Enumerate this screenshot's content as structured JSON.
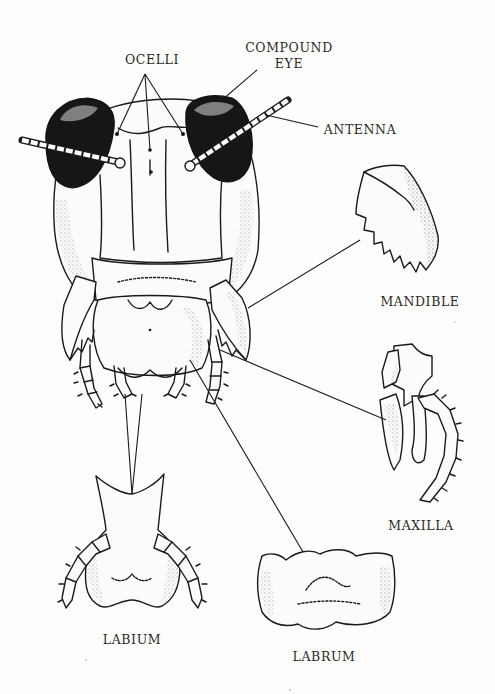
{
  "diagram": {
    "labels": {
      "ocelli": "OCELLI",
      "compound_eye_line1": "COMPOUND",
      "compound_eye_line2": "EYE",
      "antenna": "ANTENNA",
      "mandible": "MANDIBLE",
      "maxilla": "MAXILLA",
      "labium": "LABIUM",
      "labrum": "LABRUM"
    },
    "colors": {
      "ink": "#1a1a1a",
      "paper": "#fdfdfc",
      "eye_fill": "#161616"
    }
  }
}
